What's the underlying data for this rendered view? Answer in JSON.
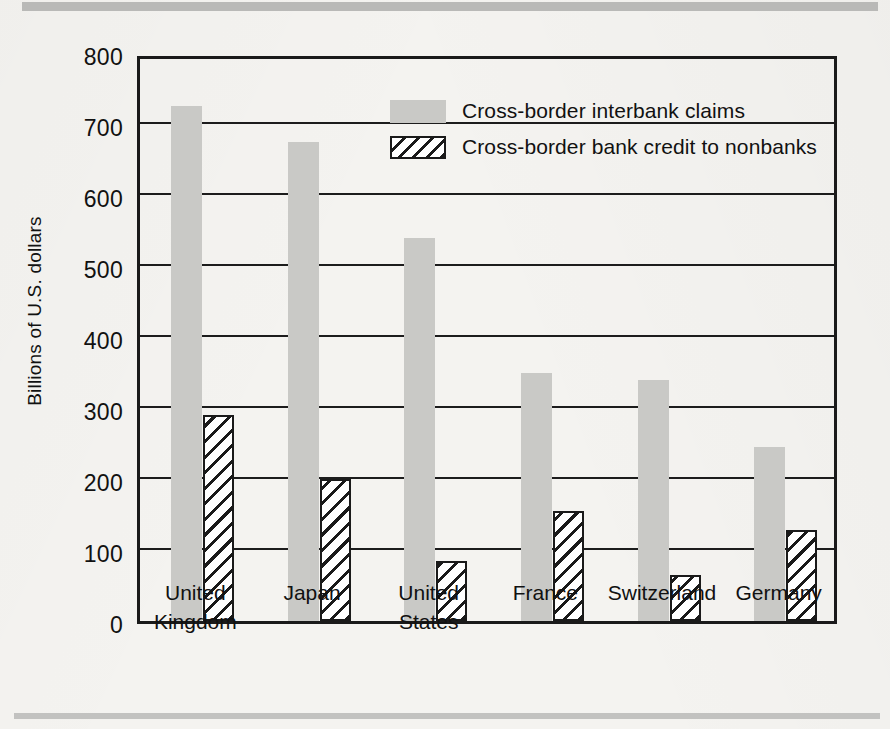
{
  "chart_data": {
    "type": "bar",
    "title": "",
    "subtitle": "",
    "xlabel": "",
    "ylabel": "Billions of U.S. dollars",
    "ylim": [
      0,
      800
    ],
    "ytick_step": 100,
    "yticks": [
      "800",
      "700",
      "600",
      "500",
      "400",
      "300",
      "200",
      "100",
      "0"
    ],
    "grid": true,
    "grid_axis": "y",
    "legend_position": "top-center-right",
    "categories": [
      "United\nKingdom",
      "Japan",
      "United\nStates",
      "France",
      "Switzerland",
      "Germany"
    ],
    "series": [
      {
        "name": "Cross-border interbank claims",
        "style": "solid-gray",
        "color": "#c9c9c6",
        "values": [
          725,
          675,
          540,
          350,
          340,
          245
        ]
      },
      {
        "name": "Cross-border bank credit to nonbanks",
        "style": "diagonal-hatch",
        "color": "#1a1a1a",
        "values": [
          290,
          200,
          85,
          155,
          65,
          128
        ]
      }
    ]
  },
  "legend": {
    "items": [
      {
        "label": "Cross-border interbank claims",
        "swatch": "solid"
      },
      {
        "label": "Cross-border bank credit to nonbanks",
        "swatch": "hatched"
      }
    ]
  },
  "colors": {
    "page_background": "#f4f3f0",
    "axis": "#1a1a1a",
    "bar_solid": "#c9c9c6",
    "bar_hatch": "#1a1a1a",
    "rule": "#b9b9b7"
  }
}
